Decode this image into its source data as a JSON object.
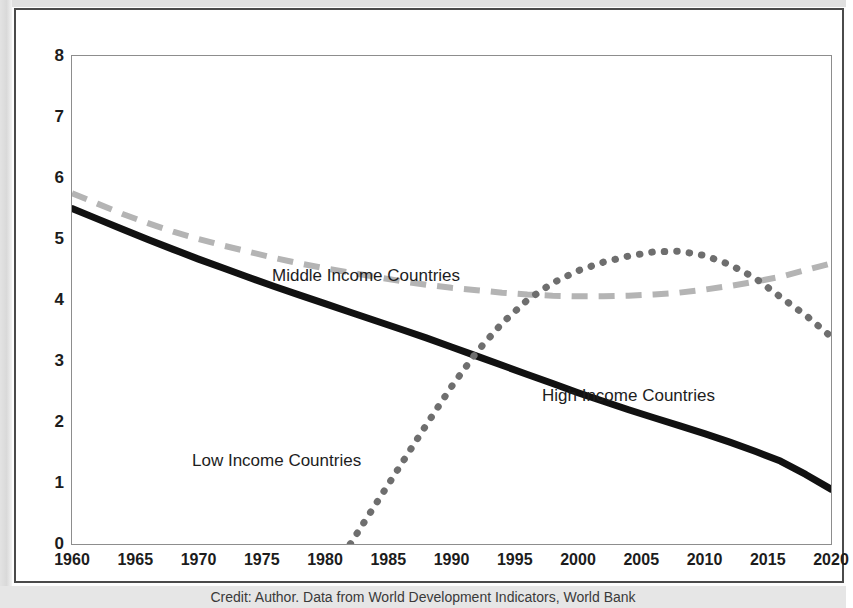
{
  "credit": "Credit: Author. Data from World Development Indicators, World Bank",
  "axis": {
    "y_ticks": [
      "0",
      "1",
      "2",
      "3",
      "4",
      "5",
      "6",
      "7",
      "8"
    ],
    "x_ticks": [
      "1960",
      "1965",
      "1970",
      "1975",
      "1980",
      "1985",
      "1990",
      "1995",
      "2000",
      "2005",
      "2010",
      "2015",
      "2020"
    ]
  },
  "annotations": {
    "middle": "Middle Income Countries",
    "high": "High Income Countries",
    "low": "Low Income Countries"
  },
  "colors": {
    "high_income": "#111111",
    "middle_income": "#b4b4b4",
    "low_income": "#6e6e6e",
    "frame": "#4a4a4a",
    "plot_border": "#8d8d8d",
    "text": "#1c1c1c"
  },
  "chart_data": {
    "type": "line",
    "title": "",
    "subtitle": "",
    "xlabel": "",
    "ylabel": "",
    "xlim": [
      1960,
      2020
    ],
    "ylim": [
      0,
      8
    ],
    "grid": false,
    "legend_position": "inline-annotations",
    "x": [
      1960,
      1962,
      1964,
      1966,
      1968,
      1970,
      1972,
      1974,
      1976,
      1978,
      1980,
      1982,
      1984,
      1986,
      1988,
      1990,
      1992,
      1994,
      1996,
      1998,
      2000,
      2002,
      2004,
      2006,
      2008,
      2010,
      2012,
      2014,
      2016,
      2018,
      2020
    ],
    "series": [
      {
        "name": "High Income Countries",
        "style": "solid-thick",
        "color": "#111111",
        "values": [
          5.5,
          5.33,
          5.16,
          4.99,
          4.83,
          4.67,
          4.52,
          4.37,
          4.22,
          4.08,
          3.94,
          3.8,
          3.66,
          3.52,
          3.38,
          3.23,
          3.08,
          2.93,
          2.78,
          2.63,
          2.48,
          2.34,
          2.2,
          2.07,
          1.94,
          1.81,
          1.67,
          1.52,
          1.36,
          1.14,
          0.9
        ]
      },
      {
        "name": "Middle Income Countries",
        "style": "dashed",
        "color": "#b4b4b4",
        "values": [
          5.75,
          5.58,
          5.41,
          5.26,
          5.12,
          5.0,
          4.89,
          4.79,
          4.69,
          4.6,
          4.52,
          4.45,
          4.38,
          4.31,
          4.25,
          4.2,
          4.16,
          4.12,
          4.09,
          4.07,
          4.06,
          4.06,
          4.07,
          4.09,
          4.12,
          4.17,
          4.23,
          4.3,
          4.38,
          4.49,
          4.6
        ]
      },
      {
        "name": "Low Income Countries",
        "style": "dotted",
        "color": "#6e6e6e",
        "values": [
          null,
          null,
          null,
          null,
          null,
          null,
          null,
          null,
          null,
          null,
          null,
          0.0,
          0.65,
          1.3,
          1.95,
          2.58,
          3.15,
          3.62,
          4.0,
          4.28,
          4.48,
          4.62,
          4.72,
          4.79,
          4.8,
          4.73,
          4.58,
          4.36,
          4.05,
          3.75,
          3.4
        ]
      }
    ],
    "notes": [
      "Low Income Countries series begins near 1983 at value 0 and rises steeply.",
      "Low Income Countries series peaks about 4.8 near 2007, then declines to about 3.4 by 2020.",
      "High Income solid line crosses the Low Income dotted line near 1991 at about 2.85.",
      "Middle Income dashed line reaches a minimum of about 4.05 around 1998-2002 then rises to about 4.6 by 2020."
    ]
  }
}
